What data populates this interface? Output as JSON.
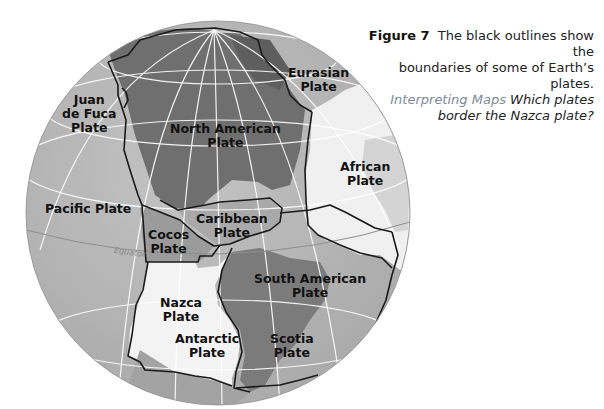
{
  "caption": {
    "figure_label": "Figure 7",
    "line1": "The black outlines show the",
    "line2": "boundaries of some of Earth’s plates.",
    "skill": "Interpreting Maps",
    "line3_rest": "Which plates",
    "line4": "border the Nazca plate?"
  },
  "map": {
    "equator_label": "Equator",
    "plates": [
      {
        "id": "juan-de-fuca",
        "lines": [
          "Juan",
          "de Fuca",
          "Plate"
        ]
      },
      {
        "id": "eurasian",
        "lines": [
          "Eurasian",
          "Plate"
        ]
      },
      {
        "id": "north-american",
        "lines": [
          "North American",
          "Plate"
        ]
      },
      {
        "id": "african",
        "lines": [
          "African",
          "Plate"
        ]
      },
      {
        "id": "pacific",
        "lines": [
          "Pacific Plate"
        ]
      },
      {
        "id": "caribbean",
        "lines": [
          "Caribbean",
          "Plate"
        ]
      },
      {
        "id": "cocos",
        "lines": [
          "Cocos",
          "Plate"
        ]
      },
      {
        "id": "south-american",
        "lines": [
          "South American",
          "Plate"
        ]
      },
      {
        "id": "nazca",
        "lines": [
          "Nazca",
          "Plate"
        ]
      },
      {
        "id": "antarctic",
        "lines": [
          "Antarctic",
          "Plate"
        ]
      },
      {
        "id": "scotia",
        "lines": [
          "Scotia",
          "Plate"
        ]
      }
    ]
  },
  "colors": {
    "ocean": "#b9b9b9",
    "land_dark": "#6e6e6e",
    "land_mid": "#8a8a8a",
    "highlight_plate": "#f2f2f2",
    "boundary": "#1a1a1a",
    "grid": "#ffffff",
    "skill_text": "#7b8a9a"
  }
}
